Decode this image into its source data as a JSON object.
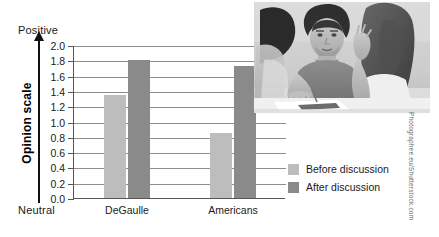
{
  "axis": {
    "positive_label": "Positive",
    "neutral_label": "Neutral",
    "y_title": "Opinion scale"
  },
  "legend": {
    "before_label": "Before discussion",
    "after_label": "After discussion",
    "before_color": "#bdbdbd",
    "after_color": "#8a8a8a"
  },
  "credit": "Photographee.eu/Shutterstock.com",
  "ticks": [
    "2.0",
    "1.8",
    "1.6",
    "1.4",
    "1.2",
    "1.0",
    "0.8",
    "0.6",
    "0.4",
    "0.2",
    "0.0"
  ],
  "categories": [
    "DeGaulle",
    "Americans"
  ],
  "chart_data": {
    "type": "bar",
    "title": "",
    "xlabel": "",
    "ylabel": "Opinion scale",
    "ylim": [
      0.0,
      2.0
    ],
    "ytick_step": 0.2,
    "ytick_labels": [
      "0.0",
      "0.2",
      "0.4",
      "0.6",
      "0.8",
      "1.0",
      "1.2",
      "1.4",
      "1.6",
      "1.8",
      "2.0"
    ],
    "y_axis_low_annotation": "Neutral",
    "y_axis_high_annotation": "Positive",
    "grid": true,
    "grid_axis": "y",
    "legend_position": "right",
    "categories": [
      "DeGaulle",
      "Americans"
    ],
    "series": [
      {
        "name": "Before discussion",
        "color": "#bdbdbd",
        "values": [
          1.35,
          0.85
        ]
      },
      {
        "name": "After discussion",
        "color": "#8a8a8a",
        "values": [
          1.81,
          1.72
        ]
      }
    ]
  }
}
